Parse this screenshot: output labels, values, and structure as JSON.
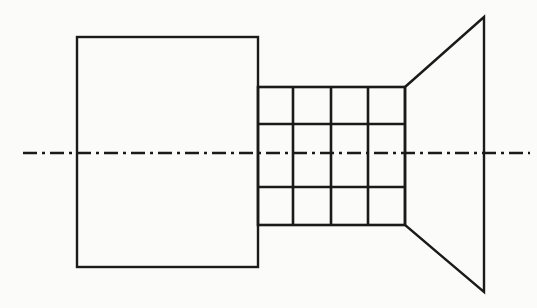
{
  "drawing": {
    "title": "Mechanical Part Orthographic Line Drawing",
    "description": "Engineering side-view line drawing of an axisymmetric component: a large rectangular body on the left, a gridded (knurled / ribbed) cylindrical mid-section, and a conical flared flange on the right, bisected by a horizontal dash-dot center axis line.",
    "canvas": {
      "width": 537,
      "height": 308,
      "background_color": "#fbfbfa"
    },
    "style": {
      "line_color": "#1a1a1a",
      "thin_stroke_width": 2,
      "thick_stroke_width": 2.6,
      "axis_stroke_width": 2.4,
      "axis_dash_pattern": "14 5 3 5"
    },
    "parts": [
      {
        "name": "left-body-rectangle",
        "shape": "rectangle",
        "x1": 77,
        "y1": 37,
        "x2": 258,
        "y2": 267,
        "width": 181,
        "height": 230
      },
      {
        "name": "knurled-midsection-grid",
        "shape": "grid",
        "x1": 258,
        "y1": 87,
        "x2": 405,
        "y2": 225,
        "width": 147,
        "height": 138,
        "column_x": [
          258,
          293,
          331,
          368,
          405
        ],
        "row_y": [
          87,
          124,
          187,
          225
        ],
        "columns": 4,
        "rows": 3
      },
      {
        "name": "conical-flange",
        "shape": "trapezoid",
        "points": "405,87 484,17 484,292 405,225",
        "apex_top": [
          484,
          17
        ],
        "apex_bottom": [
          484,
          292
        ],
        "base_top": [
          405,
          87
        ],
        "base_bottom": [
          405,
          225
        ]
      },
      {
        "name": "center-axis-line",
        "shape": "dash-dot-line",
        "x1": 23,
        "y1": 153,
        "x2": 530,
        "y2": 153,
        "length": 507
      }
    ]
  },
  "chart_data": {
    "type": "line",
    "xlabel": "",
    "ylabel": "",
    "xlim": [
      0,
      537
    ],
    "ylim": [
      0,
      308
    ],
    "grid": false,
    "legend": "none",
    "series": [
      {
        "name": "left-body-rectangle",
        "x": [
          77,
          258,
          258,
          77,
          77
        ],
        "y": [
          37,
          37,
          267,
          267,
          37
        ]
      },
      {
        "name": "grid-outer-boundary",
        "x": [
          258,
          405,
          405,
          258,
          258
        ],
        "y": [
          87,
          87,
          225,
          225,
          87
        ]
      },
      {
        "name": "grid-vertical-1",
        "x": [
          293,
          293
        ],
        "y": [
          87,
          225
        ]
      },
      {
        "name": "grid-vertical-2",
        "x": [
          331,
          331
        ],
        "y": [
          87,
          225
        ]
      },
      {
        "name": "grid-vertical-3",
        "x": [
          368,
          368
        ],
        "y": [
          87,
          225
        ]
      },
      {
        "name": "grid-horizontal-1",
        "x": [
          258,
          405
        ],
        "y": [
          124,
          124
        ]
      },
      {
        "name": "grid-horizontal-2",
        "x": [
          258,
          405
        ],
        "y": [
          187,
          187
        ]
      },
      {
        "name": "conical-flange",
        "x": [
          405,
          484,
          484,
          405
        ],
        "y": [
          87,
          17,
          292,
          225
        ]
      },
      {
        "name": "center-axis-line",
        "x": [
          23,
          530
        ],
        "y": [
          153,
          153
        ]
      }
    ]
  }
}
